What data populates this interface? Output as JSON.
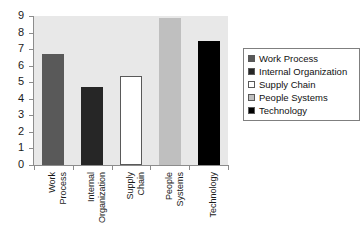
{
  "chart_data": {
    "type": "bar",
    "title": "",
    "xlabel": "",
    "ylabel": "",
    "categories": [
      "Work Process",
      "Internal Organization",
      "Supply Chain",
      "People Systems",
      "Technology"
    ],
    "category_lines": [
      [
        "Work",
        "Process"
      ],
      [
        "Internal",
        "Organization"
      ],
      [
        "Supply",
        "Chain"
      ],
      [
        "People",
        "Systems"
      ],
      [
        "Technology"
      ]
    ],
    "values": [
      6.7,
      4.7,
      5.35,
      8.9,
      7.5
    ],
    "colors": [
      "#595959",
      "#262626",
      "#ffffff",
      "#bfbfbf",
      "#000000"
    ],
    "ylim": [
      0,
      9
    ],
    "yticks": [
      0,
      1,
      2,
      3,
      4,
      5,
      6,
      7,
      8,
      9
    ],
    "ytick_labels": [
      "0",
      "1",
      "2",
      "3",
      "4",
      "5",
      "6",
      "7",
      "8",
      "9"
    ],
    "grid": false,
    "legend_position": "right",
    "plot_background": "#e8e8e8",
    "axis_color": "#8c8c8c"
  },
  "legend": {
    "items": [
      {
        "label": "Work Process",
        "color": "#595959"
      },
      {
        "label": "Internal Organization",
        "color": "#262626"
      },
      {
        "label": "Supply Chain",
        "color": "#ffffff"
      },
      {
        "label": "People Systems",
        "color": "#bfbfbf"
      },
      {
        "label": "Technology",
        "color": "#000000"
      }
    ]
  }
}
